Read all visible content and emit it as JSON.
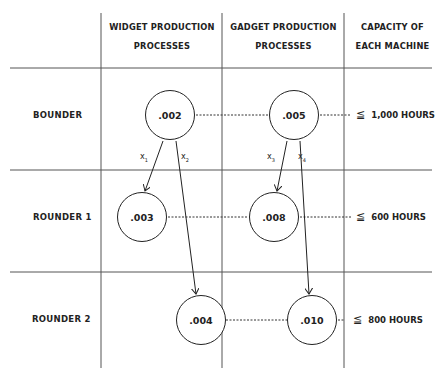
{
  "columns": {
    "widget": [
      "WIDGET PRODUCTION",
      "PROCESSES"
    ],
    "gadget": [
      "GADGET PRODUCTION",
      "PROCESSES"
    ],
    "capacity": [
      "CAPACITY OF",
      "EACH MACHINE"
    ]
  },
  "rows": [
    {
      "label": "BOUNDER",
      "widget_value": ".002",
      "gadget_value": ".005",
      "capacity": "1,000 HOURS"
    },
    {
      "label": "ROUNDER 1",
      "widget_value": ".003",
      "gadget_value": ".008",
      "capacity": "600 HOURS"
    },
    {
      "label": "ROUNDER 2",
      "widget_value": ".004",
      "gadget_value": ".010",
      "capacity": "800 HOURS"
    }
  ],
  "variables": [
    {
      "name": "x",
      "sub": "1"
    },
    {
      "name": "x",
      "sub": "2"
    },
    {
      "name": "x",
      "sub": "3"
    },
    {
      "name": "x",
      "sub": "4"
    }
  ],
  "symbols": {
    "leq": "≦"
  }
}
